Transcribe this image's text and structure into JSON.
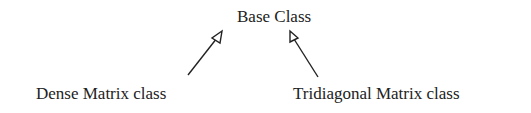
{
  "diagram": {
    "type": "class-inheritance",
    "nodes": {
      "base": "Base Class",
      "dense": "Dense Matrix class",
      "tridiagonal": "Tridiagonal Matrix class"
    },
    "edges": [
      {
        "from": "Dense Matrix class",
        "to": "Base Class",
        "style": "hollow-arrow"
      },
      {
        "from": "Tridiagonal Matrix class",
        "to": "Base Class",
        "style": "hollow-arrow"
      }
    ]
  }
}
